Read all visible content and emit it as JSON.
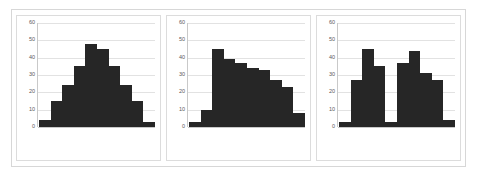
{
  "caption": {
    "text": "—  —— —— —— — —— —— —— — —— —— —— — —"
  },
  "chart_data": [
    {
      "type": "bar",
      "title": "",
      "xlabel": "",
      "ylabel": "",
      "ylim": [
        0,
        60
      ],
      "yticks": [
        0,
        10,
        20,
        30,
        40,
        50,
        60
      ],
      "grid": true,
      "legend": null,
      "bar_color": "#262626",
      "categories": [
        "",
        "",
        "",
        "",
        "",
        "",
        "",
        "",
        "",
        ""
      ],
      "values": [
        4,
        15,
        24,
        35,
        48,
        45,
        35,
        24,
        15,
        3
      ]
    },
    {
      "type": "bar",
      "title": "",
      "xlabel": "",
      "ylabel": "",
      "ylim": [
        0,
        60
      ],
      "yticks": [
        0,
        10,
        20,
        30,
        40,
        50,
        60
      ],
      "grid": true,
      "legend": null,
      "bar_color": "#262626",
      "categories": [
        "",
        "",
        "",
        "",
        "",
        "",
        "",
        "",
        "",
        ""
      ],
      "values": [
        3,
        10,
        45,
        39,
        37,
        34,
        33,
        27,
        23,
        8
      ]
    },
    {
      "type": "bar",
      "title": "",
      "xlabel": "",
      "ylabel": "",
      "ylim": [
        0,
        60
      ],
      "yticks": [
        0,
        10,
        20,
        30,
        40,
        50,
        60
      ],
      "grid": true,
      "legend": null,
      "bar_color": "#262626",
      "categories": [
        "",
        "",
        "",
        "",
        "",
        "",
        "",
        "",
        "",
        ""
      ],
      "values": [
        3,
        27,
        45,
        35,
        3,
        37,
        44,
        31,
        27,
        4
      ]
    }
  ]
}
